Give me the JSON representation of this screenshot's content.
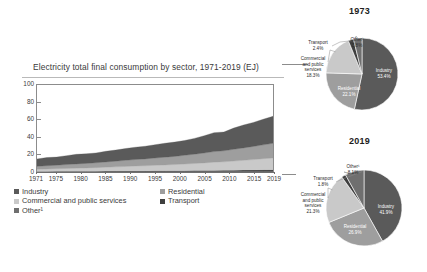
{
  "chart_data": [
    {
      "type": "area",
      "title": "Electricity total final consumption by sector, 1971-2019 (EJ)",
      "xlabel": "",
      "ylabel": "EJ",
      "ylim": [
        0,
        100
      ],
      "yticks": [
        0,
        20,
        40,
        60,
        80,
        100
      ],
      "xlim": [
        1971,
        2019
      ],
      "xticks": [
        1971,
        1975,
        1980,
        1985,
        1990,
        1995,
        2000,
        2005,
        2010,
        2015,
        2019
      ],
      "grid": false,
      "stacked": true,
      "legend_position": "below",
      "x": [
        1971,
        1973,
        1975,
        1977,
        1979,
        1981,
        1983,
        1985,
        1987,
        1989,
        1991,
        1993,
        1995,
        1997,
        1999,
        2001,
        2003,
        2005,
        2007,
        2009,
        2011,
        2013,
        2015,
        2017,
        2019
      ],
      "series": [
        {
          "name": "Other",
          "color": "#6f6f6f",
          "values": [
            0.3,
            0.3,
            0.35,
            0.4,
            0.4,
            0.45,
            0.45,
            0.5,
            0.5,
            0.55,
            0.6,
            0.6,
            0.65,
            0.7,
            0.7,
            0.75,
            0.8,
            0.85,
            0.9,
            0.9,
            0.95,
            1.0,
            1.05,
            1.1,
            1.15
          ]
        },
        {
          "name": "Transport",
          "color": "#3f3f3f",
          "values": [
            0.4,
            0.42,
            0.45,
            0.48,
            0.5,
            0.52,
            0.55,
            0.58,
            0.6,
            0.62,
            0.65,
            0.68,
            0.7,
            0.72,
            0.75,
            0.8,
            0.85,
            0.9,
            0.95,
            1.0,
            1.1,
            1.2,
            1.3,
            1.4,
            1.5
          ]
        },
        {
          "name": "Commercial and public services",
          "color": "#c9c9c9",
          "values": [
            2.4,
            2.7,
            2.9,
            3.2,
            3.5,
            3.7,
            4.0,
            4.4,
            4.8,
            5.2,
            5.6,
            5.9,
            6.3,
            6.7,
            7.1,
            7.6,
            8.1,
            8.7,
            9.4,
            9.8,
            10.5,
            11.2,
            11.9,
            12.7,
            13.5
          ]
        },
        {
          "name": "Residential",
          "color": "#9e9e9e",
          "values": [
            3.4,
            3.8,
            4.1,
            4.5,
            4.9,
            5.2,
            5.6,
            6.1,
            6.5,
            7.0,
            7.5,
            7.9,
            8.4,
            8.9,
            9.4,
            10.0,
            10.7,
            11.4,
            12.2,
            12.7,
            13.5,
            14.3,
            15.1,
            16.0,
            16.9
          ]
        },
        {
          "name": "Industry",
          "color": "#5a5a5a",
          "values": [
            8.5,
            9.4,
            9.3,
            10.2,
            11.0,
            11.0,
            11.3,
            12.2,
            12.8,
            13.6,
            14.1,
            14.5,
            15.3,
            16.0,
            16.4,
            17.0,
            18.2,
            19.8,
            21.8,
            21.5,
            24.4,
            26.3,
            27.6,
            29.4,
            31.0
          ]
        }
      ],
      "totals": [
        15.0,
        16.6,
        17.1,
        18.8,
        20.3,
        20.9,
        21.9,
        23.8,
        25.2,
        27.0,
        28.5,
        29.6,
        31.4,
        33.0,
        34.1,
        36.2,
        38.7,
        41.7,
        45.3,
        45.9,
        50.5,
        54.0,
        57.0,
        60.6,
        64.1
      ],
      "legend": [
        {
          "label": "Industry",
          "color": "#5a5a5a"
        },
        {
          "label": "Residential",
          "color": "#9e9e9e"
        },
        {
          "label": "Commercial and public services",
          "color": "#c9c9c9"
        },
        {
          "label": "Transport",
          "color": "#3f3f3f"
        },
        {
          "label": "Other¹",
          "color": "#6f6f6f"
        }
      ]
    },
    {
      "type": "pie",
      "title": "1973",
      "labels": [
        "Industry",
        "Residential",
        "Commercial and public services",
        "Transport",
        "Other¹"
      ],
      "values": [
        53.4,
        22.1,
        18.3,
        2.4,
        3.8
      ],
      "value_labels": [
        "53.4%",
        "22.1%",
        "18.3%",
        "2.4%",
        "3.8%"
      ],
      "colors": [
        "#5a5a5a",
        "#9e9e9e",
        "#c9c9c9",
        "#3f3f3f",
        "#6f6f6f"
      ]
    },
    {
      "type": "pie",
      "title": "2019",
      "labels": [
        "Industry",
        "Residential",
        "Commercial and public services",
        "Transport",
        "Other¹"
      ],
      "values": [
        41.9,
        26.9,
        21.3,
        1.8,
        8.1
      ],
      "value_labels": [
        "41.9%",
        "26.9%",
        "21.3%",
        "1.8%",
        "8.1%"
      ],
      "colors": [
        "#5a5a5a",
        "#9e9e9e",
        "#c9c9c9",
        "#3f3f3f",
        "#6f6f6f"
      ]
    }
  ],
  "area": {
    "title": "Electricity total final consumption by sector, 1971-2019 (EJ)",
    "yticks": [
      "100",
      "80",
      "60",
      "40",
      "20",
      "0"
    ],
    "xticks": [
      "1971",
      "1975",
      "1980",
      "1985",
      "1990",
      "1995",
      "2000",
      "2005",
      "2010",
      "2015",
      "2019"
    ],
    "legend": [
      {
        "label": "Industry"
      },
      {
        "label": "Residential"
      },
      {
        "label": "Commercial and public services"
      },
      {
        "label": "Transport"
      },
      {
        "label": "Other¹"
      }
    ]
  },
  "pie1973": {
    "year": "1973",
    "industry_label": "Industry",
    "industry_pct": "53.4%",
    "residential_label": "Residential",
    "residential_pct": "22.1%",
    "commercial_label": "Commercial",
    "commercial_label2": "and public",
    "commercial_label3": "services",
    "commercial_pct": "18.3%",
    "transport_label": "Transport",
    "transport_pct": "2.4%",
    "other_label": "Other¹",
    "other_pct": "3.8%"
  },
  "pie2019": {
    "year": "2019",
    "industry_label": "Industry",
    "industry_pct": "41.9%",
    "residential_label": "Residential",
    "residential_pct": "26.9%",
    "commercial_label": "Commercial",
    "commercial_label2": "and public",
    "commercial_label3": "services",
    "commercial_pct": "21.3%",
    "transport_label": "Transport",
    "transport_pct": "1.8%",
    "other_label": "Other¹",
    "other_pct": "8.1%"
  }
}
